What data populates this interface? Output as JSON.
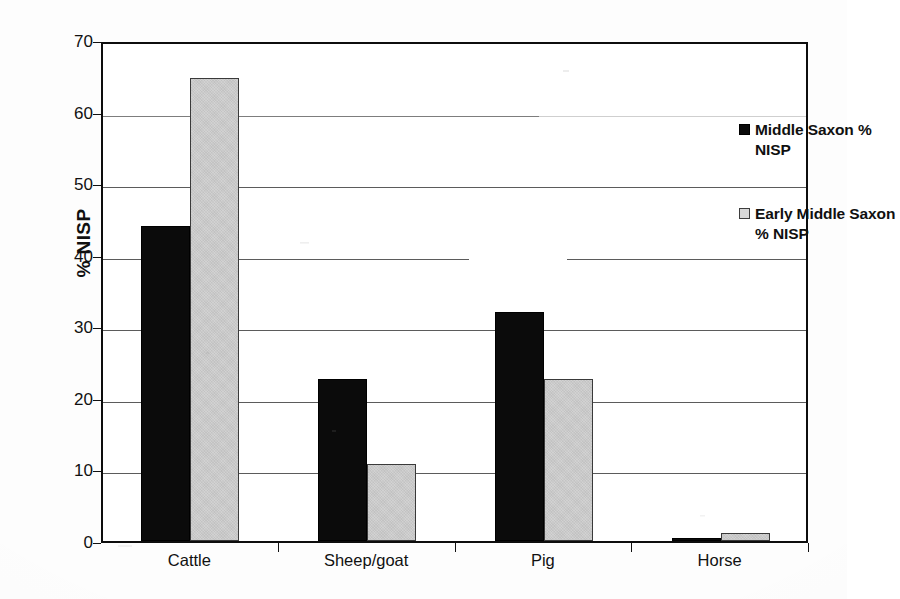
{
  "chart_data": {
    "type": "bar",
    "title": "",
    "subtitle": "",
    "xlabel": "",
    "ylabel": "% NISP",
    "categories": [
      "Cattle",
      "Sheep/goat",
      "Pig",
      "Horse"
    ],
    "series": [
      {
        "name": "Middle Saxon % NISP",
        "color": "#0b0b0b",
        "values": [
          44.0,
          22.6,
          32.0,
          0.4
        ]
      },
      {
        "name": "Early Middle Saxon % NISP",
        "color": "#d2d2d2",
        "values": [
          64.7,
          10.8,
          22.6,
          1.1
        ]
      }
    ],
    "ylim": [
      0,
      70
    ],
    "ytick_values": [
      0,
      10,
      20,
      30,
      40,
      50,
      60,
      70
    ],
    "ytick_labels": [
      "0",
      "10",
      "20",
      "30",
      "40",
      "50",
      "60",
      "70"
    ],
    "grid": true,
    "grid_axis": "y",
    "legend_position": "upper-right-inside",
    "bar_group_style": "adjacent-pairs"
  },
  "axes": {
    "y_title": "% NISP"
  },
  "legend": {
    "entries": [
      {
        "label": "Middle Saxon % NISP",
        "swatch": "filled-black-square"
      },
      {
        "label": "Early Middle Saxon % NISP",
        "swatch": "filled-gray-square"
      }
    ]
  },
  "colors": {
    "series_dark": "#0b0b0b",
    "series_light": "#d2d2d2",
    "axis": "#0d0d0d",
    "gridline": "#5b5b5b",
    "text": "#111111",
    "background": "#fdfdfd"
  }
}
